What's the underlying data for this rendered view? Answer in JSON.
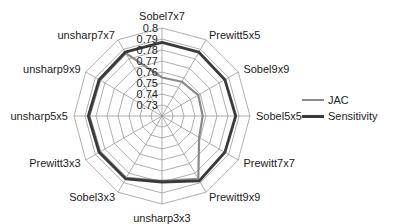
{
  "chart_data": {
    "type": "radar",
    "title": "",
    "categories": [
      "Sobel7x7",
      "Prewitt5x5",
      "Sobel9x9",
      "Sobel5x5",
      "Prewitt7x7",
      "Prewitt9x9",
      "unsharp3x3",
      "Sobel3x3",
      "Prewitt3x3",
      "unsharp5x5",
      "unsharp9x9",
      "unsharp7x7"
    ],
    "radial_ticks": [
      "0.73",
      "0.74",
      "0.75",
      "0.76",
      "0.77",
      "0.78",
      "0.79",
      "0.8"
    ],
    "range": [
      0.72,
      0.8
    ],
    "series": [
      {
        "name": "JAC",
        "color": "#8a8a8a",
        "values": [
          0.755,
          0.756,
          0.758,
          0.757,
          0.759,
          0.786,
          0.779,
          0.785,
          0.785,
          0.786,
          0.785,
          0.786
        ]
      },
      {
        "name": "Sensitivity",
        "color": "#3a3a3a",
        "values": [
          0.787,
          0.787,
          0.786,
          0.787,
          0.786,
          0.788,
          0.78,
          0.786,
          0.786,
          0.787,
          0.786,
          0.787
        ]
      }
    ],
    "legend_position": "right"
  },
  "legend": {
    "items": [
      {
        "label": "JAC"
      },
      {
        "label": "Sensitivity"
      }
    ]
  }
}
